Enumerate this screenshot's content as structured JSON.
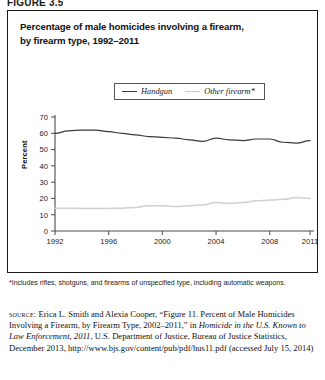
{
  "figure": {
    "tag": "FIGURE 3.5"
  },
  "chart_panel": {
    "title_line1": "Percentage of male homicides involving a firearm,",
    "title_line2": "by firearm type, 1992–2011"
  },
  "legend": {
    "position": "top-center-inside",
    "entries": [
      {
        "label": "Handgun",
        "color": "#3a3a3a",
        "icon": "line-swatch"
      },
      {
        "label": "Other firearm*",
        "color": "#c9c9c9",
        "icon": "line-swatch"
      }
    ]
  },
  "notes": {
    "footnote": "*Includes rifles, shotguns, and firearms of unspecified type, including automatic weapons.",
    "source_kicker": "source:",
    "source_part1": " Erica L. Smith and Alexia Cooper, “Figure 11. Percent of Male Homicides Involving a Firearm, by Firearm Type, 2002–2011,” in ",
    "source_italic": "Homicide in the U.S. Known to Law Enforcement, 2011",
    "source_part2": ", U.S. Department of Justice, Bureau of Justice Statistics, December 2013, http://www.bjs.gov/content/pub/pdf/hus11.pdf (accessed July 15, 2014)"
  },
  "chart_data": {
    "type": "line",
    "title": "Percentage of male homicides involving a firearm, by firearm type, 1992–2011",
    "xlabel": "",
    "ylabel": "Percent",
    "ylim": [
      0,
      70
    ],
    "yticks": [
      0,
      10,
      20,
      30,
      40,
      50,
      60,
      70
    ],
    "xlim": [
      1992,
      2011
    ],
    "xticks": [
      1992,
      1996,
      2000,
      2004,
      2008,
      2011
    ],
    "xtick_labels": [
      "1992",
      "1996",
      "2000",
      "2004",
      "2008",
      "2011"
    ],
    "grid": false,
    "legend_position": "upper center",
    "x": [
      1992,
      1993,
      1994,
      1995,
      1996,
      1997,
      1998,
      1999,
      2000,
      2001,
      2002,
      2003,
      2004,
      2005,
      2006,
      2007,
      2008,
      2009,
      2010,
      2011
    ],
    "series": [
      {
        "name": "Handgun",
        "color": "#3a3a3a",
        "values": [
          60.0,
          61.5,
          62.0,
          62.0,
          61.0,
          60.0,
          59.0,
          58.0,
          57.5,
          57.0,
          56.0,
          55.0,
          57.0,
          56.0,
          55.5,
          56.5,
          56.5,
          54.5,
          54.0,
          55.5
        ]
      },
      {
        "name": "Other firearm*",
        "color": "#d0d0d0",
        "values": [
          14.0,
          14.0,
          13.8,
          13.8,
          13.8,
          14.0,
          14.5,
          15.5,
          15.5,
          15.0,
          15.5,
          16.0,
          17.5,
          17.0,
          17.5,
          18.5,
          19.0,
          19.5,
          20.5,
          20.0
        ]
      }
    ]
  }
}
